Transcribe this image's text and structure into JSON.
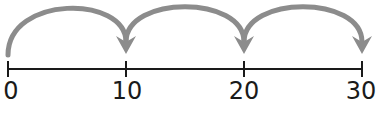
{
  "number_line": {
    "min": 0,
    "max": 30,
    "step": 10,
    "ticks": [
      {
        "value": 0,
        "label": "0",
        "x": 8
      },
      {
        "value": 10,
        "label": "10",
        "x": 126
      },
      {
        "value": 20,
        "label": "20",
        "x": 244
      },
      {
        "value": 30,
        "label": "30",
        "x": 362
      }
    ]
  },
  "jumps": [
    {
      "from": 0,
      "to": 10
    },
    {
      "from": 10,
      "to": 20
    },
    {
      "from": 20,
      "to": 30
    }
  ],
  "colors": {
    "line": "#1a1a1a",
    "arc": "#8c8c8c",
    "text": "#1a1a1a"
  }
}
